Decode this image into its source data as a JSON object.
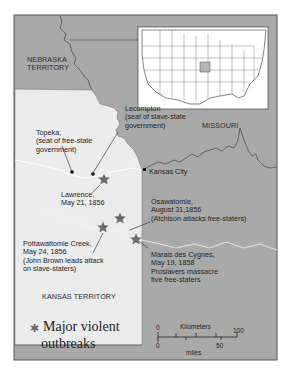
{
  "map": {
    "regions": {
      "nebraska": [
        "NEBRASKA",
        "TERRITORY"
      ],
      "missouri": "MISSOURI",
      "kansas": "KANSAS TERRITORY"
    },
    "places": {
      "topeka": [
        "Topeka,",
        "(seat of free-state",
        "government)"
      ],
      "lecompton": [
        "Lecompton",
        "(seat of slave-state",
        "government)"
      ],
      "kansas_city": "Kansas City",
      "lawrence": [
        "Lawrence,",
        "May 21, 1856"
      ],
      "osawatomie": [
        "Osawatomie,",
        "August 31,1856",
        "(Atchison attacks free-staters)"
      ],
      "pottawattomie": [
        "Pottawattomie Creek,",
        "May 24, 1856",
        "(John Brown leads attack",
        "on slave-staters)"
      ],
      "marais": [
        "Marais des Cygnes,",
        "May 19, 1858",
        "Proslavers massacre",
        "five free-staters"
      ]
    },
    "legend": {
      "icon": "star-icon",
      "label_line1": "Major violent",
      "label_line2": "outbreaks"
    },
    "scale": {
      "km_label": "Kilometers",
      "km_start": "0",
      "km_end": "100",
      "mi_label": "miles",
      "mi_start": "0",
      "mi_end": "50"
    },
    "inset": {
      "description": "Map of United States with Kansas Territory highlighted"
    },
    "colors": {
      "missouri_fill": "#a9a9a9",
      "kansas_fill": "#ececec",
      "frame": "#555555",
      "star": "#6b6b6b"
    }
  }
}
